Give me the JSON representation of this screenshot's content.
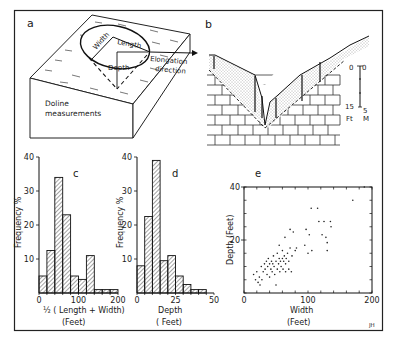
{
  "figure": {
    "credit": "JH",
    "panels": {
      "a": {
        "label": "a",
        "title_line1": "Doline",
        "title_line2": "measurements",
        "width_label": "Width",
        "length_label": "Length",
        "depth_label": "Depth",
        "elongation_line1": "Elongation",
        "elongation_line2": "direction"
      },
      "b": {
        "label": "b",
        "scale": {
          "ft_top": "0",
          "ft_bottom": "15",
          "m_top": "0",
          "m_bottom": "5",
          "ft_unit": "Ft",
          "m_unit": "M"
        }
      },
      "c": {
        "label": "c"
      },
      "d": {
        "label": "d"
      },
      "e": {
        "label": "e"
      }
    }
  },
  "chart_data": [
    {
      "panel": "c",
      "type": "bar",
      "title": "c",
      "xlabel": "1/2 ( Length + Width) (Feet)",
      "xlabel_line1": "½ ( Length + Width)",
      "xlabel_line2": "(Feet)",
      "ylabel": "Frequency %",
      "xlim": [
        0,
        200
      ],
      "ylim": [
        0,
        40
      ],
      "xticks": [
        "0",
        "100",
        "200"
      ],
      "yticks": [
        "10",
        "20",
        "30",
        "40"
      ],
      "bin_width": 20,
      "bin_starts": [
        0,
        20,
        40,
        60,
        80,
        100,
        120,
        140,
        160,
        180
      ],
      "values": [
        5,
        12.5,
        34,
        23,
        5,
        4,
        11,
        1,
        1,
        1
      ],
      "grid": false
    },
    {
      "panel": "d",
      "type": "bar",
      "title": "d",
      "xlabel": "Depth (Feet)",
      "xlabel_line1": "Depth",
      "xlabel_line2": "( Feet)",
      "ylabel": "Frequency %",
      "xlim": [
        0,
        50
      ],
      "ylim": [
        0,
        40
      ],
      "xticks": [
        "0",
        "25",
        "50"
      ],
      "yticks": [
        "10",
        "20",
        "30",
        "40"
      ],
      "bin_width": 5,
      "bin_starts": [
        0,
        5,
        10,
        15,
        20,
        25,
        30,
        35,
        40
      ],
      "values": [
        8,
        22.5,
        39,
        9.5,
        11,
        5,
        2.5,
        1,
        1
      ],
      "grid": false
    },
    {
      "panel": "e",
      "type": "scatter",
      "title": "e",
      "xlabel": "Width (Feet)",
      "xlabel_line1": "Width",
      "xlabel_line2": "(Feet)",
      "ylabel": "Depth (Feet)",
      "xlim": [
        0,
        200
      ],
      "ylim": [
        0,
        40
      ],
      "xticks": [
        "0",
        "100",
        "200"
      ],
      "yticks": [
        "20",
        "40"
      ],
      "grid": false,
      "points": [
        [
          15,
          7
        ],
        [
          18,
          5
        ],
        [
          20,
          8
        ],
        [
          22,
          4
        ],
        [
          24,
          6
        ],
        [
          25,
          3
        ],
        [
          27,
          10
        ],
        [
          28,
          5
        ],
        [
          30,
          8
        ],
        [
          32,
          11
        ],
        [
          33,
          9
        ],
        [
          35,
          12
        ],
        [
          36,
          7
        ],
        [
          37,
          10
        ],
        [
          38,
          13
        ],
        [
          40,
          11
        ],
        [
          40,
          6
        ],
        [
          42,
          9
        ],
        [
          43,
          12
        ],
        [
          44,
          8
        ],
        [
          45,
          11
        ],
        [
          46,
          14
        ],
        [
          47,
          10
        ],
        [
          48,
          7
        ],
        [
          50,
          12
        ],
        [
          50,
          3
        ],
        [
          52,
          15
        ],
        [
          52,
          9
        ],
        [
          54,
          11
        ],
        [
          55,
          13
        ],
        [
          55,
          18
        ],
        [
          56,
          8
        ],
        [
          57,
          12
        ],
        [
          58,
          10
        ],
        [
          60,
          13
        ],
        [
          60,
          16
        ],
        [
          61,
          9
        ],
        [
          62,
          12
        ],
        [
          63,
          14
        ],
        [
          64,
          21
        ],
        [
          65,
          11
        ],
        [
          65,
          8
        ],
        [
          66,
          13
        ],
        [
          68,
          15
        ],
        [
          70,
          12
        ],
        [
          70,
          9
        ],
        [
          72,
          17
        ],
        [
          72,
          24
        ],
        [
          74,
          8
        ],
        [
          75,
          14
        ],
        [
          77,
          23
        ],
        [
          80,
          16
        ],
        [
          82,
          17
        ],
        [
          95,
          18
        ],
        [
          97,
          24
        ],
        [
          100,
          15
        ],
        [
          102,
          22
        ],
        [
          105,
          32
        ],
        [
          106,
          16
        ],
        [
          115,
          32
        ],
        [
          117,
          27
        ],
        [
          122,
          22
        ],
        [
          125,
          27
        ],
        [
          128,
          21
        ],
        [
          130,
          19
        ],
        [
          130,
          16
        ],
        [
          135,
          27
        ],
        [
          136,
          25
        ],
        [
          170,
          35
        ],
        [
          188,
          40
        ]
      ]
    }
  ]
}
